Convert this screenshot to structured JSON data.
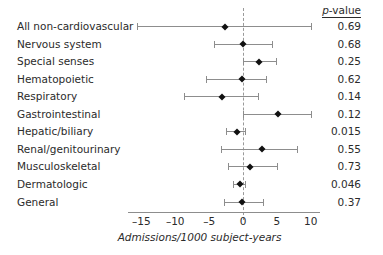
{
  "chart_data": {
    "type": "scatter",
    "subtype": "forest-plot",
    "title": "",
    "xlabel": "Admissions/1000 subject-years",
    "ylabel": "",
    "xlim": [
      -17.5,
      10.8
    ],
    "xticks": [
      -15,
      -10,
      -5,
      0,
      5,
      10
    ],
    "xticklabels": [
      "–15",
      "–10",
      "–5",
      "0",
      "5",
      "10"
    ],
    "grid": false,
    "legend": null,
    "reference_line": 0,
    "reference_line_style": "dashed",
    "columns": [
      "",
      "p-value"
    ],
    "pvalue_header": "p-value",
    "categories": [
      "All non-cardiovascular",
      "Nervous system",
      "Special senses",
      "Hematopoietic",
      "Respiratory",
      "Gastrointestinal",
      "Hepatic/biliary",
      "Renal/genitourinary",
      "Musculoskeletal",
      "Dermatologic",
      "General"
    ],
    "values": [
      -2.6,
      0.0,
      2.3,
      -0.2,
      -3.1,
      5.1,
      -0.9,
      2.8,
      1.0,
      -0.4,
      -0.1
    ],
    "ci_low": [
      -15.6,
      -4.3,
      0.0,
      -5.5,
      -8.7,
      0.0,
      -2.5,
      -3.2,
      -2.2,
      -1.5,
      -2.8
    ],
    "ci_high": [
      10.0,
      4.3,
      4.9,
      3.4,
      2.2,
      10.0,
      0.3,
      7.9,
      5.0,
      0.3,
      2.9
    ],
    "pvalues": [
      "0.69",
      "0.68",
      "0.25",
      "0.62",
      "0.14",
      "0.12",
      "0.015",
      "0.55",
      "0.73",
      "0.046",
      "0.37"
    ],
    "rows": [
      {
        "label": "All non-cardiovascular",
        "value": -2.6,
        "ci_low": -15.6,
        "ci_high": 10.0,
        "pvalue": "0.69"
      },
      {
        "label": "Nervous system",
        "value": 0.0,
        "ci_low": -4.3,
        "ci_high": 4.3,
        "pvalue": "0.68"
      },
      {
        "label": "Special senses",
        "value": 2.3,
        "ci_low": 0.0,
        "ci_high": 4.9,
        "pvalue": "0.25"
      },
      {
        "label": "Hematopoietic",
        "value": -0.2,
        "ci_low": -5.5,
        "ci_high": 3.4,
        "pvalue": "0.62"
      },
      {
        "label": "Respiratory",
        "value": -3.1,
        "ci_low": -8.7,
        "ci_high": 2.2,
        "pvalue": "0.14"
      },
      {
        "label": "Gastrointestinal",
        "value": 5.1,
        "ci_low": 0.0,
        "ci_high": 10.0,
        "pvalue": "0.12"
      },
      {
        "label": "Hepatic/biliary",
        "value": -0.9,
        "ci_low": -2.5,
        "ci_high": 0.3,
        "pvalue": "0.015"
      },
      {
        "label": "Renal/genitourinary",
        "value": 2.8,
        "ci_low": -3.2,
        "ci_high": 7.9,
        "pvalue": "0.55"
      },
      {
        "label": "Musculoskeletal",
        "value": 1.0,
        "ci_low": -2.2,
        "ci_high": 5.0,
        "pvalue": "0.73"
      },
      {
        "label": "Dermatologic",
        "value": -0.4,
        "ci_low": -1.5,
        "ci_high": 0.3,
        "pvalue": "0.046"
      },
      {
        "label": "General",
        "value": -0.1,
        "ci_low": -2.8,
        "ci_high": 2.9,
        "pvalue": "0.37"
      }
    ],
    "colors": {
      "marker": "#111111",
      "line": "#8d8d8d",
      "reference": "#9a9a9a",
      "text": "#2b2b2b",
      "background": "#ffffff"
    }
  }
}
